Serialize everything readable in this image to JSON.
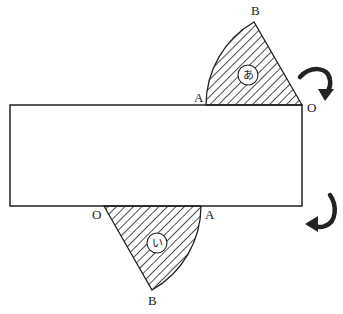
{
  "diagram": {
    "colors": {
      "stroke": "#222222",
      "hatch": "#222222",
      "background": "#ffffff"
    },
    "rectangle": {
      "x": 10,
      "y": 105,
      "width": 292,
      "height": 101
    },
    "upper_sector": {
      "name": "あ",
      "points": {
        "O": "O",
        "A": "A",
        "B": "B"
      },
      "rotation_arrow": "clockwise"
    },
    "lower_sector": {
      "name": "い",
      "points": {
        "O": "O",
        "A": "A",
        "B": "B"
      },
      "rotation_arrow": "counterclockwise"
    }
  }
}
